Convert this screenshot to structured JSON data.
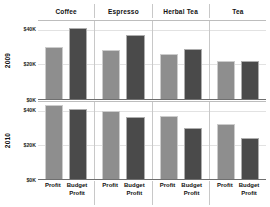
{
  "chart_data": {
    "type": "bar",
    "title": "",
    "xlabel": "",
    "ylabel": "",
    "grid": true,
    "legend_position": "none",
    "orientation": "vertical",
    "layout": "small-multiples-grid",
    "column_field": "Product",
    "row_field": "Year",
    "measure_labels": [
      "Profit",
      "Budget Profit"
    ],
    "columns": [
      "Coffee",
      "Espresso",
      "Herbal Tea",
      "Tea"
    ],
    "rows": [
      "2009",
      "2010"
    ],
    "ylim": [
      0,
      45
    ],
    "yticks": [
      0,
      20,
      40
    ],
    "ytick_labels": [
      "$0K",
      "$20K",
      "$40K"
    ],
    "units": "USD thousands",
    "series": [
      {
        "name": "Profit",
        "color": "#8e8e8e"
      },
      {
        "name": "Budget Profit",
        "color": "#4a4a4a"
      }
    ],
    "panels": [
      {
        "row": "2009",
        "cells": [
          {
            "column": "Coffee",
            "values": [
              30,
              41
            ]
          },
          {
            "column": "Espresso",
            "values": [
              28,
              37
            ]
          },
          {
            "column": "Herbal Tea",
            "values": [
              26,
              29
            ]
          },
          {
            "column": "Tea",
            "values": [
              22,
              22
            ]
          }
        ]
      },
      {
        "row": "2010",
        "cells": [
          {
            "column": "Coffee",
            "values": [
              43,
              41
            ]
          },
          {
            "column": "Espresso",
            "values": [
              40,
              36
            ]
          },
          {
            "column": "Herbal Tea",
            "values": [
              37,
              30
            ]
          },
          {
            "column": "Tea",
            "values": [
              32,
              24
            ]
          }
        ]
      }
    ]
  },
  "colors": {
    "profit": "#8e8e8e",
    "budget_profit": "#4a4a4a",
    "gridline": "#e2e2e2",
    "panel_border": "#c8c8c8",
    "axis": "#6f6f6f",
    "background": "#ffffff"
  },
  "axis": {
    "x_tick_labels": [
      {
        "line1": "Profit",
        "line2": ""
      },
      {
        "line1": "Budget",
        "line2": "Profit"
      }
    ]
  }
}
